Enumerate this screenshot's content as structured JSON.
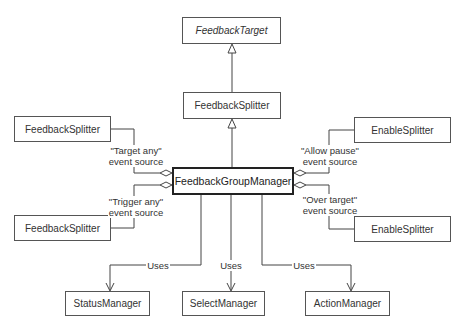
{
  "diagram": {
    "type": "UML class diagram",
    "classes": {
      "feedback_target": "FeedbackTarget",
      "feedback_splitter_center": "FeedbackSplitter",
      "feedback_group_manager": "FeedbackGroupManager",
      "feedback_splitter_left_top": "FeedbackSplitter",
      "feedback_splitter_left_bottom": "FeedbackSplitter",
      "enable_splitter_right_top": "EnableSplitter",
      "enable_splitter_right_bottom": "EnableSplitter",
      "status_manager": "StatusManager",
      "select_manager": "SelectManager",
      "action_manager": "ActionManager"
    },
    "labels": {
      "target_any_1": "\"Target any\"",
      "target_any_2": "event source",
      "trigger_any_1": "\"Trigger any\"",
      "trigger_any_2": "event source",
      "allow_pause_1": "\"Allow pause\"",
      "allow_pause_2": "event source",
      "over_target_1": "\"Over target\"",
      "over_target_2": "event source",
      "uses_status": "Uses",
      "uses_select": "Uses",
      "uses_action": "Uses"
    },
    "relationships": [
      {
        "from": "FeedbackSplitter",
        "to": "FeedbackTarget",
        "kind": "generalization"
      },
      {
        "from": "FeedbackGroupManager",
        "to": "FeedbackSplitter",
        "kind": "generalization"
      },
      {
        "from": "FeedbackGroupManager",
        "to": "FeedbackSplitter",
        "kind": "aggregation",
        "role": "Target any event source"
      },
      {
        "from": "FeedbackGroupManager",
        "to": "FeedbackSplitter",
        "kind": "aggregation",
        "role": "Trigger any event source"
      },
      {
        "from": "FeedbackGroupManager",
        "to": "EnableSplitter",
        "kind": "aggregation",
        "role": "Allow pause event source"
      },
      {
        "from": "FeedbackGroupManager",
        "to": "EnableSplitter",
        "kind": "aggregation",
        "role": "Over target event source"
      },
      {
        "from": "FeedbackGroupManager",
        "to": "StatusManager",
        "kind": "dependency",
        "label": "Uses"
      },
      {
        "from": "FeedbackGroupManager",
        "to": "SelectManager",
        "kind": "dependency",
        "label": "Uses"
      },
      {
        "from": "FeedbackGroupManager",
        "to": "ActionManager",
        "kind": "dependency",
        "label": "Uses"
      }
    ]
  }
}
